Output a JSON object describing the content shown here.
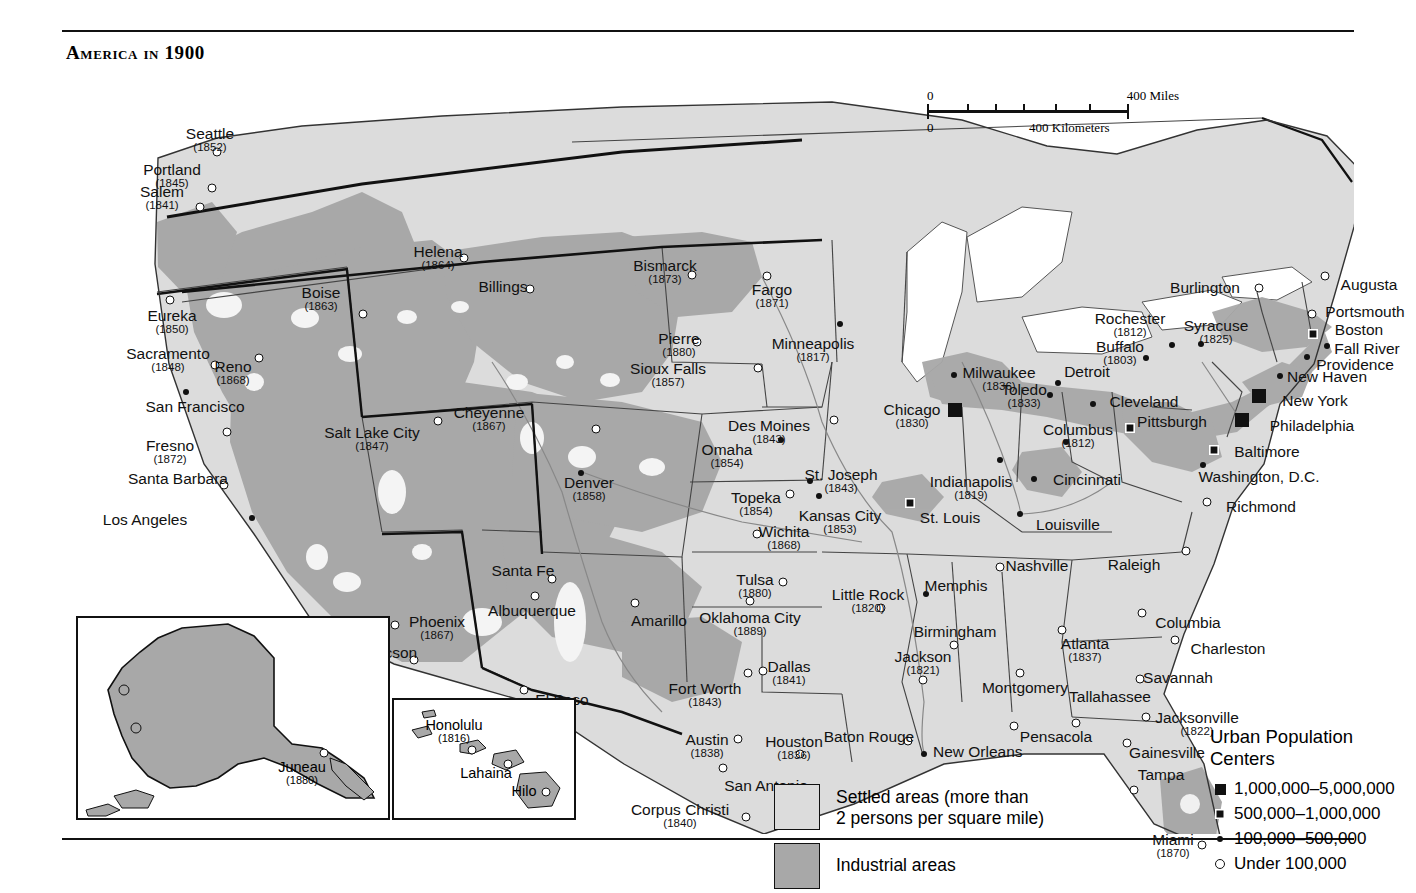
{
  "page": {
    "title": "America in 1900"
  },
  "scale": {
    "miles_zero": "0",
    "miles_max": "400 Miles",
    "km_zero": "0",
    "km_max": "400 Kilometers"
  },
  "area_legend": {
    "settled_label": "Settled areas (more than 2 persons per square mile)",
    "settled_line1": "Settled areas (more than",
    "settled_line2": "2 persons per square mile)",
    "industrial_label": "Industrial areas",
    "settled_color": "#dcdcdc",
    "industrial_color": "#a8a8a8"
  },
  "population_legend": {
    "title_line1": "Urban Population",
    "title_line2": "Centers",
    "entries": [
      {
        "symbol": "big-square",
        "label": "1,000,000–5,000,000"
      },
      {
        "symbol": "crossed-square",
        "label": "500,000–1,000,000"
      },
      {
        "symbol": "filled-dot",
        "label": "100,000–500,000"
      },
      {
        "symbol": "open-circle",
        "label": "Under 100,000"
      }
    ]
  },
  "insets": {
    "alaska": {
      "cities": [
        {
          "name": "Juneau",
          "year": "(1880)",
          "symbol": "open-circle",
          "x": 246,
          "y": 135,
          "lx": 224,
          "ly": 142
        }
      ]
    },
    "hawaii": {
      "cities": [
        {
          "name": "Honolulu",
          "year": "(1816)",
          "symbol": "open-circle",
          "x": 78,
          "y": 50,
          "lx": 60,
          "ly": 18
        },
        {
          "name": "Lahaina",
          "year": "",
          "symbol": "open-circle",
          "x": 114,
          "y": 64,
          "lx": 92,
          "ly": 66
        },
        {
          "name": "Hilo",
          "year": "",
          "symbol": "open-circle",
          "x": 152,
          "y": 92,
          "lx": 130,
          "ly": 84
        }
      ]
    }
  },
  "cities": [
    {
      "name": "Seattle",
      "year": "(1852)",
      "symbol": "open-circle",
      "sx": 155,
      "sy": 90,
      "lx": 148,
      "ly": 64,
      "align": "center"
    },
    {
      "name": "Portland",
      "year": "(1845)",
      "symbol": "open-circle",
      "sx": 150,
      "sy": 126,
      "lx": 110,
      "ly": 100,
      "align": "center"
    },
    {
      "name": "Salem",
      "year": "(1841)",
      "symbol": "open-circle",
      "sx": 138,
      "sy": 145,
      "lx": 100,
      "ly": 122,
      "align": "center"
    },
    {
      "name": "Eureka",
      "year": "(1850)",
      "symbol": "open-circle",
      "sx": 108,
      "sy": 238,
      "lx": 110,
      "ly": 246,
      "align": "center"
    },
    {
      "name": "Sacramento",
      "year": "(1848)",
      "symbol": "open-circle",
      "sx": 153,
      "sy": 303,
      "lx": 106,
      "ly": 284,
      "align": "center"
    },
    {
      "name": "San Francisco",
      "year": "",
      "symbol": "filled-dot",
      "sx": 124,
      "sy": 330,
      "lx": 133,
      "ly": 337,
      "align": "center"
    },
    {
      "name": "Fresno",
      "year": "(1872)",
      "symbol": "open-circle",
      "sx": 165,
      "sy": 370,
      "lx": 108,
      "ly": 376,
      "align": "center"
    },
    {
      "name": "Santa Barbara",
      "year": "",
      "symbol": "open-circle",
      "sx": 162,
      "sy": 423,
      "lx": 116,
      "ly": 409,
      "align": "center"
    },
    {
      "name": "Los Angeles",
      "year": "",
      "symbol": "filled-dot",
      "sx": 190,
      "sy": 456,
      "lx": 83,
      "ly": 450,
      "align": "center"
    },
    {
      "name": "Boise",
      "year": "(1863)",
      "symbol": "open-circle",
      "sx": 301,
      "sy": 252,
      "lx": 259,
      "ly": 223,
      "align": "center"
    },
    {
      "name": "Reno",
      "year": "(1868)",
      "symbol": "open-circle",
      "sx": 197,
      "sy": 296,
      "lx": 171,
      "ly": 297,
      "align": "center"
    },
    {
      "name": "Helena",
      "year": "(1864)",
      "symbol": "open-circle",
      "sx": 402,
      "sy": 196,
      "lx": 376,
      "ly": 182,
      "align": "center"
    },
    {
      "name": "Billings",
      "year": "",
      "symbol": "open-circle",
      "sx": 468,
      "sy": 227,
      "lx": 441,
      "ly": 217,
      "align": "center"
    },
    {
      "name": "Salt Lake City",
      "year": "(1847)",
      "symbol": "open-circle",
      "sx": 376,
      "sy": 359,
      "lx": 310,
      "ly": 363,
      "align": "center"
    },
    {
      "name": "Cheyenne",
      "year": "(1867)",
      "symbol": "open-circle",
      "sx": 534,
      "sy": 367,
      "lx": 427,
      "ly": 343,
      "align": "center"
    },
    {
      "name": "Denver",
      "year": "(1858)",
      "symbol": "filled-dot",
      "sx": 519,
      "sy": 411,
      "lx": 527,
      "ly": 413,
      "align": "center"
    },
    {
      "name": "Bismarck",
      "year": "(1873)",
      "symbol": "open-circle",
      "sx": 630,
      "sy": 213,
      "lx": 603,
      "ly": 196,
      "align": "center"
    },
    {
      "name": "Fargo",
      "year": "(1871)",
      "symbol": "open-circle",
      "sx": 705,
      "sy": 214,
      "lx": 710,
      "ly": 220,
      "align": "center"
    },
    {
      "name": "Pierre",
      "year": "(1880)",
      "symbol": "open-circle",
      "sx": 635,
      "sy": 280,
      "lx": 617,
      "ly": 269,
      "align": "center"
    },
    {
      "name": "Sioux Falls",
      "year": "(1857)",
      "symbol": "open-circle",
      "sx": 696,
      "sy": 306,
      "lx": 606,
      "ly": 299,
      "align": "center"
    },
    {
      "name": "Minneapolis",
      "year": "(1817)",
      "symbol": "filled-dot",
      "sx": 778,
      "sy": 262,
      "lx": 751,
      "ly": 274,
      "align": "center"
    },
    {
      "name": "Des Moines",
      "year": "(1843)",
      "symbol": "open-circle",
      "sx": 772,
      "sy": 358,
      "lx": 707,
      "ly": 356,
      "align": "center"
    },
    {
      "name": "Omaha",
      "year": "(1854)",
      "symbol": "filled-dot",
      "sx": 719,
      "sy": 378,
      "lx": 665,
      "ly": 380,
      "align": "center"
    },
    {
      "name": "St. Joseph",
      "year": "(1843)",
      "symbol": "filled-dot",
      "sx": 748,
      "sy": 419,
      "lx": 779,
      "ly": 405,
      "align": "center"
    },
    {
      "name": "Topeka",
      "year": "(1854)",
      "symbol": "open-circle",
      "sx": 728,
      "sy": 432,
      "lx": 694,
      "ly": 428,
      "align": "center"
    },
    {
      "name": "Kansas City",
      "year": "(1853)",
      "symbol": "filled-dot",
      "sx": 757,
      "sy": 434,
      "lx": 778,
      "ly": 446,
      "align": "center"
    },
    {
      "name": "Wichita",
      "year": "(1868)",
      "symbol": "open-circle",
      "sx": 695,
      "sy": 472,
      "lx": 722,
      "ly": 462,
      "align": "center"
    },
    {
      "name": "Tulsa",
      "year": "(1880)",
      "symbol": "open-circle",
      "sx": 721,
      "sy": 520,
      "lx": 693,
      "ly": 510,
      "align": "center"
    },
    {
      "name": "Oklahoma City",
      "year": "(1889)",
      "symbol": "open-circle",
      "sx": 688,
      "sy": 539,
      "lx": 688,
      "ly": 548,
      "align": "center"
    },
    {
      "name": "Santa Fe",
      "year": "",
      "symbol": "open-circle",
      "sx": 490,
      "sy": 517,
      "lx": 461,
      "ly": 501,
      "align": "center"
    },
    {
      "name": "Albuquerque",
      "year": "",
      "symbol": "open-circle",
      "sx": 473,
      "sy": 534,
      "lx": 470,
      "ly": 541,
      "align": "center"
    },
    {
      "name": "Phoenix",
      "year": "(1867)",
      "symbol": "open-circle",
      "sx": 333,
      "sy": 563,
      "lx": 375,
      "ly": 552,
      "align": "center"
    },
    {
      "name": "Tucson",
      "year": "",
      "symbol": "open-circle",
      "sx": 352,
      "sy": 598,
      "lx": 330,
      "ly": 583,
      "align": "center"
    },
    {
      "name": "Amarillo",
      "year": "",
      "symbol": "open-circle",
      "sx": 573,
      "sy": 541,
      "lx": 597,
      "ly": 551,
      "align": "center"
    },
    {
      "name": "El Paso",
      "year": "",
      "symbol": "open-circle",
      "sx": 462,
      "sy": 628,
      "lx": 500,
      "ly": 630,
      "align": "center"
    },
    {
      "name": "Fort Worth",
      "year": "(1843)",
      "symbol": "open-circle",
      "sx": 686,
      "sy": 611,
      "lx": 643,
      "ly": 619,
      "align": "center"
    },
    {
      "name": "Dallas",
      "year": "(1841)",
      "symbol": "open-circle",
      "sx": 701,
      "sy": 609,
      "lx": 727,
      "ly": 597,
      "align": "center"
    },
    {
      "name": "Austin",
      "year": "(1838)",
      "symbol": "open-circle",
      "sx": 676,
      "sy": 677,
      "lx": 645,
      "ly": 670,
      "align": "center"
    },
    {
      "name": "Houston",
      "year": "(1836)",
      "symbol": "open-circle",
      "sx": 738,
      "sy": 692,
      "lx": 732,
      "ly": 672,
      "align": "center"
    },
    {
      "name": "San Antonio",
      "year": "",
      "symbol": "open-circle",
      "sx": 661,
      "sy": 706,
      "lx": 704,
      "ly": 716,
      "align": "center"
    },
    {
      "name": "Corpus Christi",
      "year": "(1840)",
      "symbol": "open-circle",
      "sx": 684,
      "sy": 755,
      "lx": 618,
      "ly": 740,
      "align": "center"
    },
    {
      "name": "Baton Rouge",
      "year": "",
      "symbol": "open-circle",
      "sx": 846,
      "sy": 679,
      "lx": 807,
      "ly": 667,
      "align": "center"
    },
    {
      "name": "New Orleans",
      "year": "",
      "symbol": "filled-dot",
      "sx": 862,
      "sy": 692,
      "lx": 871,
      "ly": 682,
      "align": "left"
    },
    {
      "name": "Little Rock",
      "year": "(1820)",
      "symbol": "open-circle",
      "sx": 819,
      "sy": 546,
      "lx": 806,
      "ly": 525,
      "align": "center"
    },
    {
      "name": "Memphis",
      "year": "",
      "symbol": "filled-dot",
      "sx": 864,
      "sy": 532,
      "lx": 894,
      "ly": 516,
      "align": "center"
    },
    {
      "name": "Nashville",
      "year": "",
      "symbol": "open-circle",
      "sx": 938,
      "sy": 505,
      "lx": 975,
      "ly": 496,
      "align": "center"
    },
    {
      "name": "Birmingham",
      "year": "",
      "symbol": "open-circle",
      "sx": 892,
      "sy": 583,
      "lx": 893,
      "ly": 562,
      "align": "center"
    },
    {
      "name": "Jackson",
      "year": "(1821)",
      "symbol": "open-circle",
      "sx": 861,
      "sy": 618,
      "lx": 861,
      "ly": 587,
      "align": "center"
    },
    {
      "name": "Montgomery",
      "year": "",
      "symbol": "open-circle",
      "sx": 958,
      "sy": 611,
      "lx": 963,
      "ly": 618,
      "align": "center"
    },
    {
      "name": "Tallahassee",
      "year": "",
      "symbol": "open-circle",
      "sx": 1014,
      "sy": 661,
      "lx": 1048,
      "ly": 627,
      "align": "center"
    },
    {
      "name": "Pensacola",
      "year": "",
      "symbol": "open-circle",
      "sx": 952,
      "sy": 664,
      "lx": 994,
      "ly": 667,
      "align": "center"
    },
    {
      "name": "Atlanta",
      "year": "(1837)",
      "symbol": "open-circle",
      "sx": 1000,
      "sy": 568,
      "lx": 1023,
      "ly": 574,
      "align": "center"
    },
    {
      "name": "Savannah",
      "year": "",
      "symbol": "open-circle",
      "sx": 1078,
      "sy": 617,
      "lx": 1116,
      "ly": 608,
      "align": "center"
    },
    {
      "name": "Charleston",
      "year": "",
      "symbol": "open-circle",
      "sx": 1113,
      "sy": 578,
      "lx": 1166,
      "ly": 579,
      "align": "center"
    },
    {
      "name": "Columbia",
      "year": "",
      "symbol": "open-circle",
      "sx": 1080,
      "sy": 551,
      "lx": 1126,
      "ly": 553,
      "align": "center"
    },
    {
      "name": "Raleigh",
      "year": "",
      "symbol": "open-circle",
      "sx": 1124,
      "sy": 489,
      "lx": 1072,
      "ly": 495,
      "align": "center"
    },
    {
      "name": "Jacksonville",
      "year": "(1822)",
      "symbol": "open-circle",
      "sx": 1084,
      "sy": 655,
      "lx": 1135,
      "ly": 648,
      "align": "center"
    },
    {
      "name": "Gainesville",
      "year": "",
      "symbol": "open-circle",
      "sx": 1065,
      "sy": 681,
      "lx": 1105,
      "ly": 683,
      "align": "center"
    },
    {
      "name": "Tampa",
      "year": "",
      "symbol": "open-circle",
      "sx": 1072,
      "sy": 728,
      "lx": 1099,
      "ly": 705,
      "align": "center"
    },
    {
      "name": "Miami",
      "year": "(1870)",
      "symbol": "open-circle",
      "sx": 1140,
      "sy": 783,
      "lx": 1111,
      "ly": 770,
      "align": "center"
    },
    {
      "name": "Milwaukee",
      "year": "(1836)",
      "symbol": "filled-dot",
      "sx": 892,
      "sy": 313,
      "lx": 937,
      "ly": 303,
      "align": "center"
    },
    {
      "name": "Chicago",
      "year": "(1830)",
      "symbol": "big-square",
      "sx": 893,
      "sy": 348,
      "lx": 850,
      "ly": 340,
      "align": "center"
    },
    {
      "name": "Detroit",
      "year": "",
      "symbol": "filled-dot",
      "sx": 996,
      "sy": 321,
      "lx": 1025,
      "ly": 302,
      "align": "center"
    },
    {
      "name": "Toledo",
      "year": "(1833)",
      "symbol": "filled-dot",
      "sx": 988,
      "sy": 333,
      "lx": 962,
      "ly": 320,
      "align": "center"
    },
    {
      "name": "Cleveland",
      "year": "",
      "symbol": "filled-dot",
      "sx": 1031,
      "sy": 342,
      "lx": 1082,
      "ly": 332,
      "align": "center"
    },
    {
      "name": "Columbus",
      "year": "(1812)",
      "symbol": "filled-dot",
      "sx": 1004,
      "sy": 380,
      "lx": 1016,
      "ly": 360,
      "align": "center"
    },
    {
      "name": "Cincinnati",
      "year": "",
      "symbol": "filled-dot",
      "sx": 972,
      "sy": 417,
      "lx": 1025,
      "ly": 410,
      "align": "center"
    },
    {
      "name": "Indianapolis",
      "year": "(1819)",
      "symbol": "filled-dot",
      "sx": 938,
      "sy": 398,
      "lx": 909,
      "ly": 412,
      "align": "center"
    },
    {
      "name": "St. Louis",
      "year": "",
      "symbol": "crossed-square",
      "sx": 848,
      "sy": 441,
      "lx": 888,
      "ly": 448,
      "align": "center"
    },
    {
      "name": "Louisville",
      "year": "",
      "symbol": "filled-dot",
      "sx": 958,
      "sy": 452,
      "lx": 1006,
      "ly": 455,
      "align": "center"
    },
    {
      "name": "Pittsburgh",
      "year": "",
      "symbol": "crossed-square",
      "sx": 1068,
      "sy": 366,
      "lx": 1110,
      "ly": 352,
      "align": "center"
    },
    {
      "name": "Buffalo",
      "year": "(1803)",
      "symbol": "filled-dot",
      "sx": 1084,
      "sy": 296,
      "lx": 1058,
      "ly": 277,
      "align": "center"
    },
    {
      "name": "Rochester",
      "year": "(1812)",
      "symbol": "filled-dot",
      "sx": 1110,
      "sy": 283,
      "lx": 1068,
      "ly": 249,
      "align": "center"
    },
    {
      "name": "Syracuse",
      "year": "(1825)",
      "symbol": "filled-dot",
      "sx": 1139,
      "sy": 282,
      "lx": 1154,
      "ly": 256,
      "align": "center"
    },
    {
      "name": "Burlington",
      "year": "",
      "symbol": "open-circle",
      "sx": 1197,
      "sy": 226,
      "lx": 1143,
      "ly": 218,
      "align": "center"
    },
    {
      "name": "Augusta",
      "year": "",
      "symbol": "open-circle",
      "sx": 1263,
      "sy": 214,
      "lx": 1307,
      "ly": 215,
      "align": "center"
    },
    {
      "name": "Portsmouth",
      "year": "",
      "symbol": "open-circle",
      "sx": 1250,
      "sy": 252,
      "lx": 1303,
      "ly": 242,
      "align": "center"
    },
    {
      "name": "Boston",
      "year": "",
      "symbol": "crossed-square",
      "sx": 1251,
      "sy": 272,
      "lx": 1297,
      "ly": 260,
      "align": "center"
    },
    {
      "name": "Fall River",
      "year": "",
      "symbol": "filled-dot",
      "sx": 1265,
      "sy": 284,
      "lx": 1305,
      "ly": 279,
      "align": "center"
    },
    {
      "name": "Providence",
      "year": "",
      "symbol": "filled-dot",
      "sx": 1245,
      "sy": 295,
      "lx": 1293,
      "ly": 295,
      "align": "center"
    },
    {
      "name": "New Haven",
      "year": "",
      "symbol": "filled-dot",
      "sx": 1218,
      "sy": 314,
      "lx": 1265,
      "ly": 307,
      "align": "center"
    },
    {
      "name": "New York",
      "year": "",
      "symbol": "big-square",
      "sx": 1197,
      "sy": 334,
      "lx": 1253,
      "ly": 331,
      "align": "center"
    },
    {
      "name": "Philadelphia",
      "year": "",
      "symbol": "big-square",
      "sx": 1180,
      "sy": 358,
      "lx": 1250,
      "ly": 356,
      "align": "center"
    },
    {
      "name": "Baltimore",
      "year": "",
      "symbol": "crossed-square",
      "sx": 1152,
      "sy": 388,
      "lx": 1205,
      "ly": 382,
      "align": "center"
    },
    {
      "name": "Washington, D.C.",
      "year": "",
      "symbol": "filled-dot",
      "sx": 1141,
      "sy": 403,
      "lx": 1197,
      "ly": 407,
      "align": "center"
    },
    {
      "name": "Richmond",
      "year": "",
      "symbol": "open-circle",
      "sx": 1145,
      "sy": 440,
      "lx": 1199,
      "ly": 437,
      "align": "center"
    }
  ]
}
